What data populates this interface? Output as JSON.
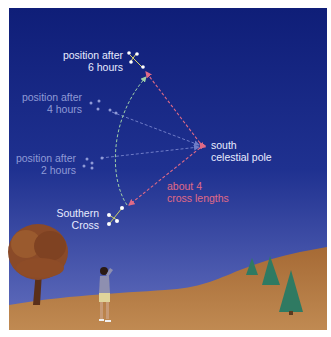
{
  "diagram": {
    "colors": {
      "sky_top": "#0f1e78",
      "sky_bottom": "#5866b8",
      "ground": "#b0773f",
      "label_bright": "#e8ecff",
      "label_faint": "#8f9ad6",
      "pointer_arrow": "#e06a86",
      "rotation_arc": "#9fd0a8",
      "tree_green": "#2f7a62"
    },
    "labels": {
      "pos6_line1": "position after",
      "pos6_line2": "6 hours",
      "pos4_line1": "position after",
      "pos4_line2": "4 hours",
      "pos2_line1": "position after",
      "pos2_line2": "2 hours",
      "pole_line1": "south",
      "pole_line2": "celestial pole",
      "distance_line1": "about 4",
      "distance_line2": "cross lengths",
      "cross_line1": "Southern",
      "cross_line2": "Cross"
    }
  }
}
